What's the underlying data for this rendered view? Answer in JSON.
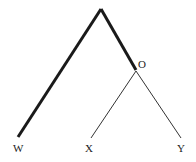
{
  "diagram": {
    "type": "tree",
    "root": {
      "x": 101,
      "y": 9
    },
    "internal_node": {
      "label": "O",
      "x": 136,
      "y": 70
    },
    "leaves": [
      {
        "label": "W",
        "x": 18,
        "y": 137
      },
      {
        "label": "X",
        "x": 91,
        "y": 138
      },
      {
        "label": "Y",
        "x": 181,
        "y": 138
      }
    ],
    "edges": [
      {
        "from": "root",
        "to": "W",
        "style": "thick"
      },
      {
        "from": "root",
        "to": "O",
        "style": "thick"
      },
      {
        "from": "O",
        "to": "X",
        "style": "thin"
      },
      {
        "from": "O",
        "to": "Y",
        "style": "thin"
      }
    ],
    "colors": {
      "line": "#1a1a1a",
      "label": "#222222"
    }
  }
}
